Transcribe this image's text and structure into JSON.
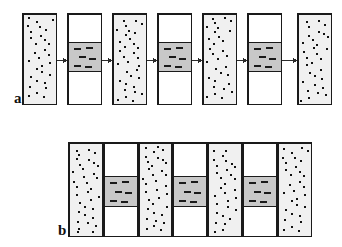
{
  "figure": {
    "background_color": "#ffffff",
    "width": 342,
    "height": 247,
    "colors": {
      "outline": "#1a1a1a",
      "speckle_fill": "#f0f0f0",
      "speckle_dot": "#111111",
      "plain_fill": "#ffffff",
      "band_fill": "#c8c8c8",
      "band_dash": "#1a1a1a",
      "arrow": "#2b2b2b",
      "label": "#101010"
    }
  },
  "panels": [
    {
      "id": "panel-a",
      "label": "a",
      "label_x": 14,
      "label_y": 103,
      "arrows_between_columns": true,
      "columns_touch": false,
      "columns": [
        {
          "type": "speckled",
          "x": 22,
          "y": 13,
          "w": 35,
          "h": 92
        },
        {
          "type": "banded",
          "x": 67,
          "y": 13,
          "w": 35,
          "h": 92,
          "band_top": 42,
          "band_height": 30
        },
        {
          "type": "speckled",
          "x": 112,
          "y": 13,
          "w": 35,
          "h": 92
        },
        {
          "type": "banded",
          "x": 157,
          "y": 13,
          "w": 35,
          "h": 92,
          "band_top": 42,
          "band_height": 30
        },
        {
          "type": "speckled",
          "x": 202,
          "y": 13,
          "w": 35,
          "h": 92
        },
        {
          "type": "banded",
          "x": 247,
          "y": 13,
          "w": 35,
          "h": 92,
          "band_top": 42,
          "band_height": 30
        },
        {
          "type": "speckled",
          "x": 297,
          "y": 13,
          "w": 35,
          "h": 92
        }
      ],
      "arrows": [
        {
          "x1": 57,
          "x2": 67,
          "y": 60
        },
        {
          "x1": 102,
          "x2": 112,
          "y": 60
        },
        {
          "x1": 147,
          "x2": 157,
          "y": 60
        },
        {
          "x1": 192,
          "x2": 202,
          "y": 60
        },
        {
          "x1": 237,
          "x2": 247,
          "y": 60
        },
        {
          "x1": 282,
          "x2": 297,
          "y": 60
        }
      ]
    },
    {
      "id": "panel-b",
      "label": "b",
      "label_x": 58,
      "label_y": 235,
      "arrows_between_columns": false,
      "columns_touch": true,
      "columns": [
        {
          "type": "speckled",
          "x": 68,
          "y": 142,
          "w": 35,
          "h": 95
        },
        {
          "type": "banded",
          "x": 103,
          "y": 142,
          "w": 35,
          "h": 95,
          "band_top": 176,
          "band_height": 31
        },
        {
          "type": "speckled",
          "x": 138,
          "y": 142,
          "w": 34,
          "h": 95
        },
        {
          "type": "banded",
          "x": 172,
          "y": 142,
          "w": 35,
          "h": 95,
          "band_top": 176,
          "band_height": 31
        },
        {
          "type": "speckled",
          "x": 207,
          "y": 142,
          "w": 35,
          "h": 95
        },
        {
          "type": "banded",
          "x": 242,
          "y": 142,
          "w": 35,
          "h": 95,
          "band_top": 176,
          "band_height": 31
        },
        {
          "type": "speckled",
          "x": 277,
          "y": 142,
          "w": 35,
          "h": 95
        }
      ],
      "arrows": []
    }
  ],
  "speckle_pattern": {
    "dot_size": 2,
    "dots_per_column": 30,
    "offsets": [
      [
        0.18,
        0.04
      ],
      [
        0.62,
        0.03
      ],
      [
        0.86,
        0.07
      ],
      [
        0.34,
        0.09
      ],
      [
        0.08,
        0.14
      ],
      [
        0.52,
        0.15
      ],
      [
        0.74,
        0.18
      ],
      [
        0.26,
        0.2
      ],
      [
        0.92,
        0.21
      ],
      [
        0.44,
        0.25
      ],
      [
        0.14,
        0.28
      ],
      [
        0.66,
        0.3
      ],
      [
        0.36,
        0.34
      ],
      [
        0.84,
        0.35
      ],
      [
        0.06,
        0.39
      ],
      [
        0.56,
        0.41
      ],
      [
        0.24,
        0.45
      ],
      [
        0.76,
        0.47
      ],
      [
        0.46,
        0.51
      ],
      [
        0.12,
        0.54
      ],
      [
        0.9,
        0.56
      ],
      [
        0.64,
        0.6
      ],
      [
        0.3,
        0.63
      ],
      [
        0.5,
        0.67
      ],
      [
        0.8,
        0.7
      ],
      [
        0.16,
        0.73
      ],
      [
        0.4,
        0.77
      ],
      [
        0.7,
        0.8
      ],
      [
        0.22,
        0.84
      ],
      [
        0.58,
        0.86
      ],
      [
        0.88,
        0.89
      ],
      [
        0.34,
        0.92
      ],
      [
        0.1,
        0.95
      ],
      [
        0.66,
        0.96
      ]
    ]
  },
  "band_pattern": {
    "dash_width": 7,
    "dash_height": 2,
    "rows": 3,
    "dashes_per_row": 2,
    "offsets": [
      [
        0.14,
        0.2
      ],
      [
        0.56,
        0.17
      ],
      [
        0.3,
        0.48
      ],
      [
        0.66,
        0.52
      ],
      [
        0.12,
        0.78
      ],
      [
        0.52,
        0.8
      ]
    ]
  }
}
